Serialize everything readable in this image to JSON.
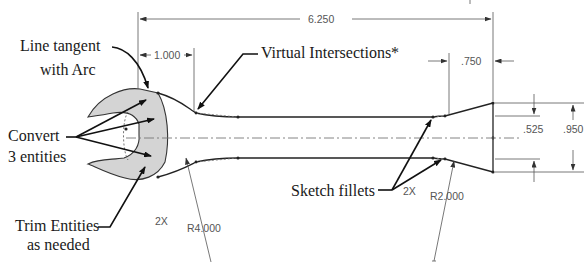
{
  "callouts": {
    "line_tangent_1": "Line tangent",
    "line_tangent_2": "with Arc",
    "virtual_intersections": "Virtual Intersections*",
    "convert_1": "Convert",
    "convert_2": "3 entities",
    "trim_1": "Trim Entities",
    "trim_2": "as needed",
    "sketch_fillets": "Sketch fillets"
  },
  "dimensions": {
    "overall_length": "6.250",
    "neck_length": "1.000",
    "taper_length": ".750",
    "inner_width": ".525",
    "outer_width": ".950",
    "large_radius": "R4.000",
    "small_radius": "R2.000",
    "qty_left": "2X",
    "qty_right": "2X"
  },
  "colors": {
    "head_fill": "#d4d4d4",
    "line": "#222222",
    "dimension_text": "#555555"
  }
}
